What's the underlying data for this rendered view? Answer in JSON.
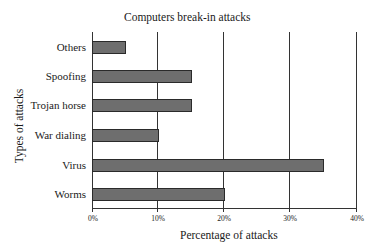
{
  "chart_data": {
    "type": "bar",
    "orientation": "horizontal",
    "title": "Computers break-in attacks",
    "xlabel": "Percentage of attacks",
    "ylabel": "Types of attacks",
    "categories": [
      "Others",
      "Spoofing",
      "Trojan horse",
      "War dialing",
      "Virus",
      "Worms"
    ],
    "values": [
      5,
      15,
      15,
      10,
      35,
      20
    ],
    "xlim": [
      0,
      40
    ],
    "xticks": [
      "0%",
      "10%",
      "20%",
      "30%",
      "40%"
    ],
    "grid": "vertical",
    "bar_color": "#6e6e6e"
  }
}
